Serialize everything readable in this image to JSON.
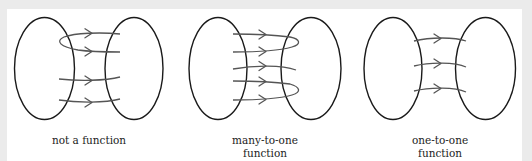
{
  "figure": {
    "panels": [
      {
        "id": "not-a-function",
        "caption_lines": [
          "not a function"
        ],
        "arrow_count": 4,
        "description": "One element maps to two elements"
      },
      {
        "id": "many-to-one",
        "caption_lines": [
          "many-to-one",
          "function"
        ],
        "arrow_count": 5,
        "description": "Several elements map to the same element"
      },
      {
        "id": "one-to-one",
        "caption_lines": [
          "one-to-one",
          "function"
        ],
        "arrow_count": 3,
        "description": "Each element maps to a unique element"
      }
    ]
  },
  "colors": {
    "background": "#ebebeb",
    "panel": "#ffffff",
    "ellipse_stroke": "#1a1a1a",
    "arrow_stroke": "#555555"
  }
}
